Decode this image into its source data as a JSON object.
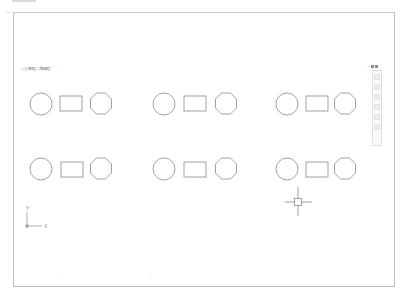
{
  "viewport": {
    "label": "[-][俯视][二维线框]",
    "controls": [
      "—",
      "□",
      "×"
    ]
  },
  "navigation_bar": {
    "buttons": [
      "steering-wheel",
      "pan",
      "zoom",
      "orbit",
      "showmotion",
      "down-arrow"
    ]
  },
  "ucs_icon": {
    "x_label": "X",
    "y_label": "Y"
  },
  "drawing": {
    "rows": 2,
    "groups_per_row": 3,
    "group_shapes": [
      "circle",
      "rectangle",
      "octagon"
    ],
    "line_color": "#8a8a8a"
  }
}
